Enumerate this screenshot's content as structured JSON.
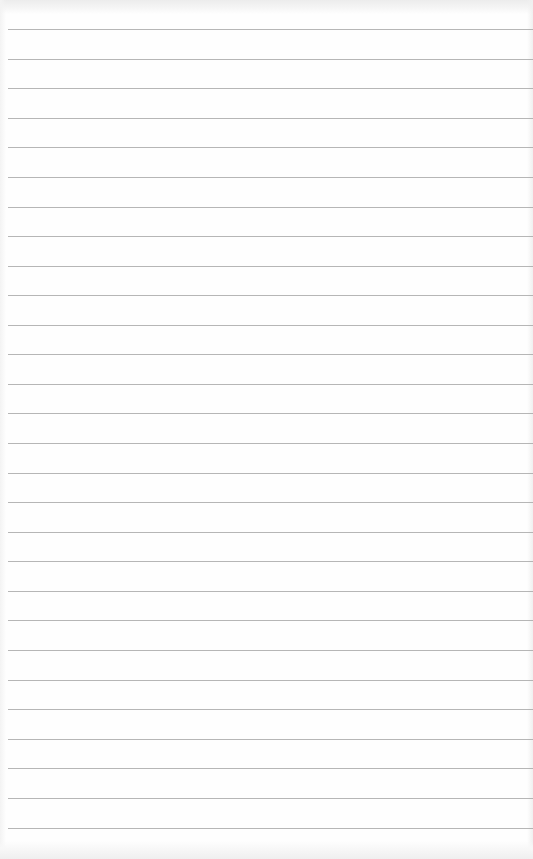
{
  "paper": {
    "type": "lined-notepaper",
    "background_color": "#fefefe",
    "rule_color": "#a9a9a9",
    "rule_left_offset": 8,
    "rules_y": [
      29,
      59,
      88,
      118,
      147,
      177,
      207,
      236,
      266,
      295,
      325,
      354,
      384,
      413,
      443,
      473,
      502,
      532,
      561,
      591,
      620,
      650,
      680,
      709,
      739,
      768,
      798,
      828
    ]
  }
}
